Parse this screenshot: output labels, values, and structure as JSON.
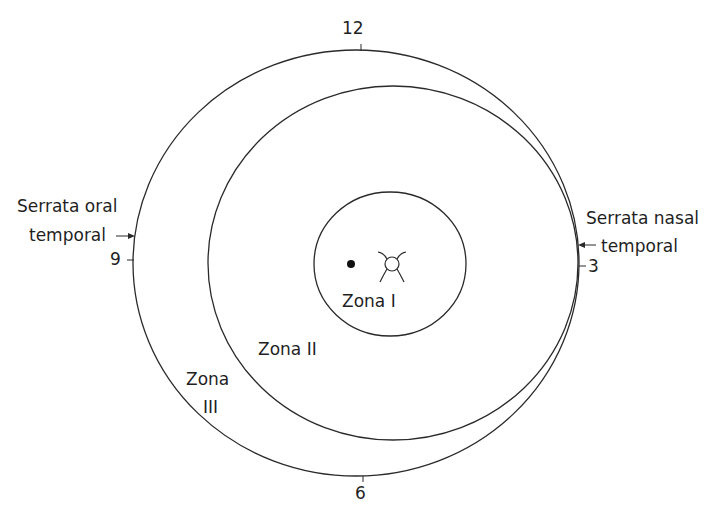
{
  "clock_labels": {
    "twelve": "12",
    "three": "3",
    "six": "6",
    "nine": "9"
  },
  "side_labels": {
    "left_line1": "Serrata oral",
    "left_line2": "temporal",
    "right_line1": "Serrata nasal",
    "right_line2": "temporal"
  },
  "zones": {
    "zone1": "Zona I",
    "zone2": "Zona II",
    "zone3_line1": "Zona",
    "zone3_line2": "III"
  },
  "colors": {
    "stroke": "#2a2a2a",
    "background": "#ffffff"
  }
}
